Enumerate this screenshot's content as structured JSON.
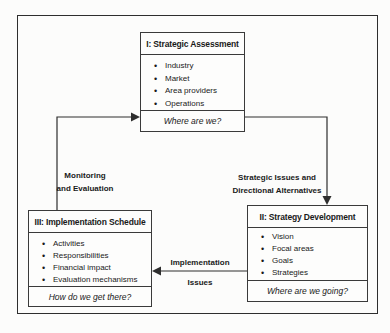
{
  "diagram": {
    "boxes": [
      {
        "id": "I",
        "title": "I: Strategic Assessment",
        "items": [
          "Industry",
          "Market",
          "Area providers",
          "Operations"
        ],
        "footer": "Where are we?"
      },
      {
        "id": "II",
        "title": "II: Strategy Development",
        "items": [
          "Vision",
          "Focal areas",
          "Goals",
          "Strategies"
        ],
        "footer": "Where are we going?"
      },
      {
        "id": "III",
        "title": "III: Implementation Schedule",
        "items": [
          "Activities",
          "Responsibilities",
          "Financial impact",
          "Evaluation mechanisms"
        ],
        "footer": "How do we get there?"
      }
    ],
    "arrows": [
      {
        "from": "III",
        "to": "I",
        "label_line1": "Monitoring",
        "label_line2": "and Evaluation"
      },
      {
        "from": "I",
        "to": "II",
        "label_line1": "Strategic Issues and",
        "label_line2": "Directional Alternatives"
      },
      {
        "from": "II",
        "to": "III",
        "label_line1": "Implementation",
        "label_line2": "Issues"
      }
    ],
    "colors": {
      "line": "#2e2e2e",
      "text": "#1a1a1a",
      "background": "#fcfcfb"
    }
  }
}
